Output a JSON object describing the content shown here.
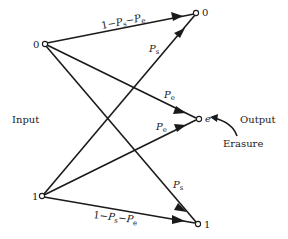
{
  "diagram": {
    "type": "binary symmetric erasure channel",
    "side_labels": {
      "input": "Input",
      "output": "Output",
      "erasure": "Erasure"
    },
    "inputs": [
      {
        "id": "in0",
        "label": "0"
      },
      {
        "id": "in1",
        "label": "1"
      }
    ],
    "outputs": [
      {
        "id": "out0",
        "label": "0"
      },
      {
        "id": "oute",
        "label": "e"
      },
      {
        "id": "out1",
        "label": "1"
      }
    ],
    "edges": [
      {
        "from": "in0",
        "to": "out0",
        "label": {
          "pre": "1−",
          "p1": "P",
          "s1": "s",
          "mid": "−",
          "p2": "P",
          "s2": "e"
        }
      },
      {
        "from": "in0",
        "to": "oute",
        "label": {
          "p": "P",
          "s": "e"
        }
      },
      {
        "from": "in0",
        "to": "out1",
        "label": {
          "p": "P",
          "s": "s"
        }
      },
      {
        "from": "in1",
        "to": "out0",
        "label": {
          "p": "P",
          "s": "s"
        }
      },
      {
        "from": "in1",
        "to": "oute",
        "label": {
          "p": "P",
          "s": "e"
        }
      },
      {
        "from": "in1",
        "to": "out1",
        "label": {
          "pre": "1−",
          "p1": "P",
          "s1": "s",
          "mid": "−",
          "p2": "P",
          "s2": "e"
        }
      }
    ]
  }
}
